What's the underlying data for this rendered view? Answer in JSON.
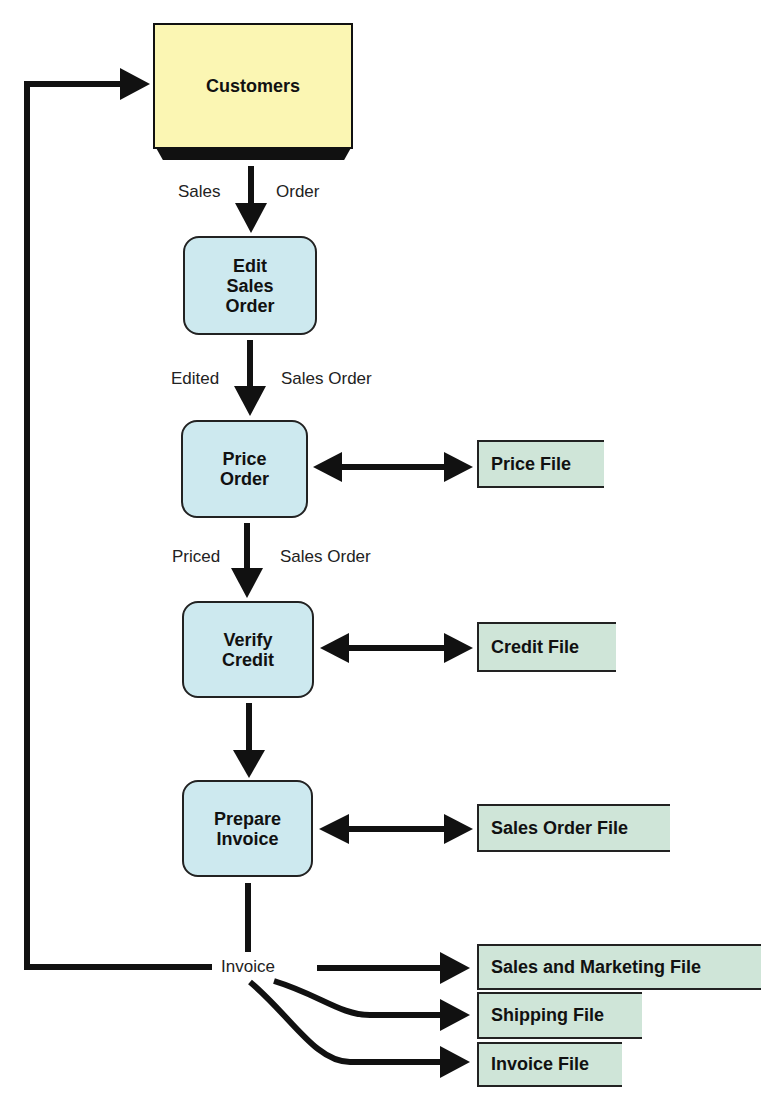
{
  "colors": {
    "entity_fill": "#fbf6b3",
    "process_fill": "#cde9ef",
    "store_fill": "#cfe5d8",
    "line": "#111111"
  },
  "external_entity": {
    "label": "Customers"
  },
  "processes": [
    {
      "label": "Edit\nSales\nOrder"
    },
    {
      "label": "Price\nOrder"
    },
    {
      "label": "Verify\nCredit"
    },
    {
      "label": "Prepare\nInvoice"
    }
  ],
  "data_stores": [
    {
      "label": "Price File"
    },
    {
      "label": "Credit File"
    },
    {
      "label": "Sales Order File"
    },
    {
      "label": "Sales and Marketing File"
    },
    {
      "label": "Shipping File"
    },
    {
      "label": "Invoice File"
    }
  ],
  "flows": {
    "sales_order_left": "Sales",
    "sales_order_right": "Order",
    "edited_left": "Edited",
    "edited_right": "Sales Order",
    "priced_left": "Priced",
    "priced_right": "Sales Order",
    "invoice": "Invoice"
  }
}
